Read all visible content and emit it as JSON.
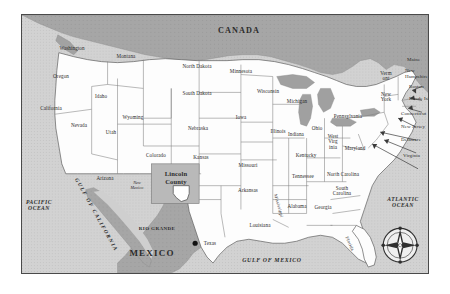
{
  "figure": {
    "kind": "reference-map"
  },
  "colors": {
    "land": "#fdfdfd",
    "water": "#9d9d9d",
    "foreign_land": "#a8a8a8",
    "highlight_box": "#bcbcbc",
    "border": "#4a4a4a",
    "state_line": "#6f6f6f",
    "text": "#2b2b2b",
    "marker": "#111111"
  },
  "countries": [
    {
      "name": "CANADA",
      "x": 238,
      "y": 30
    },
    {
      "name": "MEXICO",
      "x": 151,
      "y": 253
    }
  ],
  "oceans": [
    {
      "name": "PACIFIC OCEAN",
      "x": 38,
      "y": 205
    },
    {
      "name": "ATLANTIC OCEAN",
      "x": 402,
      "y": 202
    },
    {
      "name": "GULF OF MEXICO",
      "x": 271,
      "y": 259
    },
    {
      "name": "GULF OF CALIFORNIA",
      "x": 95,
      "y": 214
    }
  ],
  "states": [
    {
      "name": "Washington",
      "x": 71,
      "y": 48
    },
    {
      "name": "Oregon",
      "x": 60,
      "y": 76
    },
    {
      "name": "California",
      "x": 50,
      "y": 108
    },
    {
      "name": "Nevada",
      "x": 78,
      "y": 125
    },
    {
      "name": "Idaho",
      "x": 100,
      "y": 96
    },
    {
      "name": "Montana",
      "x": 125,
      "y": 56
    },
    {
      "name": "Wyoming",
      "x": 132,
      "y": 117
    },
    {
      "name": "Utah",
      "x": 110,
      "y": 132
    },
    {
      "name": "Arizona",
      "x": 104,
      "y": 178
    },
    {
      "name": "Colorado",
      "x": 155,
      "y": 155
    },
    {
      "name": "North Dakota",
      "x": 196,
      "y": 66
    },
    {
      "name": "South Dakota",
      "x": 196,
      "y": 93
    },
    {
      "name": "Nebraska",
      "x": 197,
      "y": 128
    },
    {
      "name": "Kansas",
      "x": 200,
      "y": 157
    },
    {
      "name": "Minnesota",
      "x": 240,
      "y": 71
    },
    {
      "name": "Iowa",
      "x": 240,
      "y": 117
    },
    {
      "name": "Missouri",
      "x": 247,
      "y": 165
    },
    {
      "name": "Arkansas",
      "x": 247,
      "y": 190
    },
    {
      "name": "Louisiana",
      "x": 259,
      "y": 225
    },
    {
      "name": "Texas",
      "x": 209,
      "y": 243
    },
    {
      "name": "Wisconsin",
      "x": 267,
      "y": 91
    },
    {
      "name": "Illinois",
      "x": 277,
      "y": 131
    },
    {
      "name": "Michigan",
      "x": 296,
      "y": 101
    },
    {
      "name": "Indiana",
      "x": 295,
      "y": 134
    },
    {
      "name": "Ohio",
      "x": 316,
      "y": 128
    },
    {
      "name": "Kentucky",
      "x": 305,
      "y": 155
    },
    {
      "name": "Tennessee",
      "x": 302,
      "y": 176
    },
    {
      "name": "Mississippi",
      "x": 277,
      "y": 205
    },
    {
      "name": "Alabama",
      "x": 296,
      "y": 206
    },
    {
      "name": "Georgia",
      "x": 322,
      "y": 207
    },
    {
      "name": "Florida",
      "x": 348,
      "y": 243
    },
    {
      "name": "Pennsylvania",
      "x": 347,
      "y": 116
    },
    {
      "name": "North Carolina",
      "x": 342,
      "y": 174
    },
    {
      "name": "South Carolina",
      "x": 341,
      "y": 190,
      "two_line": true
    }
  ],
  "states_multiline": [
    {
      "name": "West Virg inia",
      "lines": [
        "West",
        "Virg",
        "inia"
      ],
      "x": 332,
      "y": 141
    },
    {
      "name": "Maryland",
      "lines": [
        "Maryland"
      ],
      "x": 354,
      "y": 148
    },
    {
      "name": "New York",
      "lines": [
        "New",
        "York"
      ],
      "x": 385,
      "y": 96
    },
    {
      "name": "Vermont",
      "lines": [
        "Verm",
        "ont"
      ],
      "x": 385,
      "y": 75
    },
    {
      "name": "New Mexico",
      "lines": [
        "New",
        "Mexico"
      ],
      "x": 136,
      "y": 185
    }
  ],
  "northeast_callouts": [
    {
      "label": "Maine",
      "x": 406,
      "y": 59
    },
    {
      "label": "New Hampshire",
      "x": 404,
      "y": 72
    },
    {
      "label": "Boston",
      "x": 408,
      "y": 86
    },
    {
      "label": "Rhode Island",
      "x": 408,
      "y": 98
    },
    {
      "label": "Connecticut",
      "x": 400,
      "y": 113
    },
    {
      "label": "New Jersey",
      "x": 400,
      "y": 126
    },
    {
      "label": "Delaware",
      "x": 400,
      "y": 139
    },
    {
      "label": "Virginia",
      "x": 402,
      "y": 155
    }
  ],
  "highlight": {
    "county_label": "Lincoln County",
    "state_label": "New Mexico",
    "box_x": 130,
    "box_y": 150
  },
  "markers": [
    {
      "name": "RIO GRANDE",
      "label": "RIO GRANDE",
      "x": 156,
      "y": 228
    }
  ],
  "compass": {
    "name": "compass-rose",
    "x": 403,
    "y": 253,
    "radius": 17
  }
}
